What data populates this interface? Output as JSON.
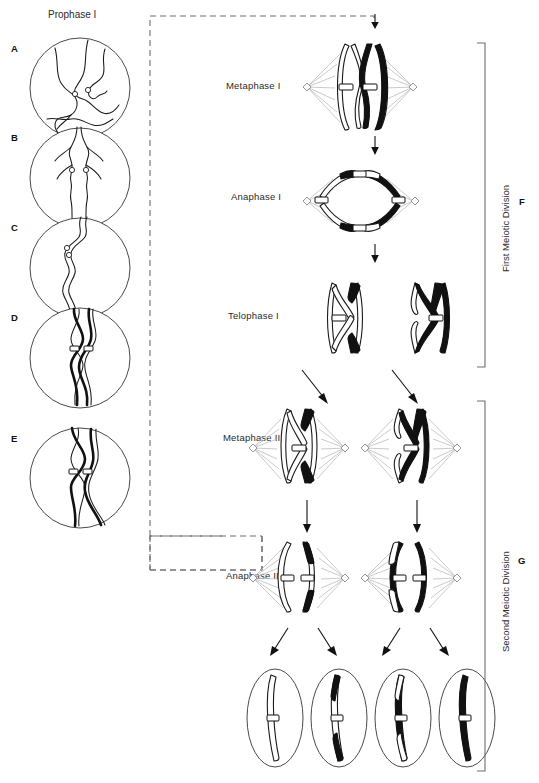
{
  "figure": {
    "type": "biology-diagram",
    "prophase_title": "Prophase I",
    "panel_letters": [
      "A",
      "B",
      "C",
      "D",
      "E",
      "F",
      "G"
    ],
    "prophase_panels": [
      {
        "letter": "A",
        "stage_hint": "leptotene"
      },
      {
        "letter": "B",
        "stage_hint": "zygotene"
      },
      {
        "letter": "C",
        "stage_hint": "pachytene"
      },
      {
        "letter": "D",
        "stage_hint": "diplotene"
      },
      {
        "letter": "E",
        "stage_hint": "diakinesis"
      }
    ],
    "stages": [
      {
        "label": "Metaphase I"
      },
      {
        "label": "Anaphase I"
      },
      {
        "label": "Telophase I"
      },
      {
        "label": "Metaphase II"
      },
      {
        "label": "Anaphase II"
      }
    ],
    "brackets": [
      {
        "label": "First Meiotic Division",
        "letter": "F"
      },
      {
        "label": "Second Meiotic Division",
        "letter": "G"
      }
    ],
    "gamete_count": 4,
    "colors": {
      "line": "#1a1a1a",
      "dark_chromosome": "#111111",
      "light_chromosome": "#ffffff",
      "spindle": "#bdbdbd",
      "bracket": "#6e6e6e",
      "dashed_flow": "#6e6e6e"
    }
  }
}
